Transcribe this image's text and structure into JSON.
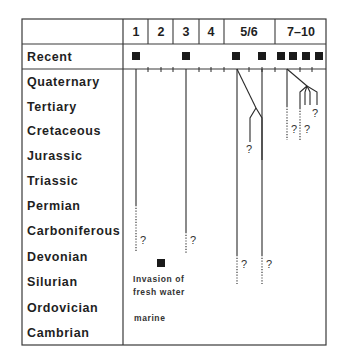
{
  "header": {
    "columns": [
      {
        "label": "1",
        "x": 136
      },
      {
        "label": "2",
        "x": 161
      },
      {
        "label": "3",
        "x": 186
      },
      {
        "label": "4",
        "x": 211
      },
      {
        "label": "5/6",
        "x": 249
      },
      {
        "label": "7–10",
        "x": 301
      }
    ]
  },
  "periods": [
    {
      "name": "Recent",
      "y": 61
    },
    {
      "name": "Quaternary",
      "y": 86
    },
    {
      "name": "Tertiary",
      "y": 111
    },
    {
      "name": "Cretaceous",
      "y": 135
    },
    {
      "name": "Jurassic",
      "y": 160
    },
    {
      "name": "Triassic",
      "y": 185
    },
    {
      "name": "Permian",
      "y": 210
    },
    {
      "name": "Carboniferous",
      "y": 235
    },
    {
      "name": "Devonian",
      "y": 261
    },
    {
      "name": "Silurian",
      "y": 286
    },
    {
      "name": "Ordovician",
      "y": 312
    },
    {
      "name": "Cambrian",
      "y": 337
    }
  ],
  "recent_markers_x": [
    136,
    186,
    236,
    262,
    281,
    293,
    306,
    319
  ],
  "annotations": {
    "question_mark": "?",
    "invasion_line1": "Invasion of",
    "invasion_line2": "fresh water",
    "marine": "marine"
  },
  "colors": {
    "line": "#2a2a2a",
    "frame": "#3a3a3a",
    "marker": "#1a1a1a"
  }
}
